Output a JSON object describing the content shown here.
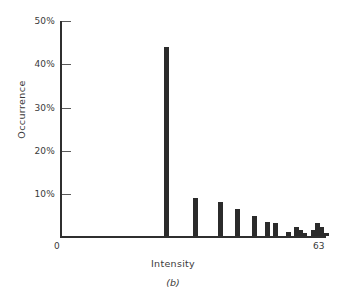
{
  "figure": {
    "caption": "(b)",
    "ylabel": "Occurrence",
    "xlabel": "Intensity",
    "ink_color": "#2b2b2b",
    "background": "#ffffff"
  },
  "chart_data": {
    "type": "bar",
    "title": "",
    "subtitle": "",
    "caption": "(b)",
    "xlabel": "Intensity",
    "ylabel": "Occurrence",
    "xlim": [
      0,
      63
    ],
    "ylim": [
      0,
      50
    ],
    "grid": false,
    "legend": null,
    "ytick_labels": [
      "50%",
      "40%",
      "30%",
      "20%",
      "10%"
    ],
    "ytick_values": [
      50,
      40,
      30,
      20,
      10
    ],
    "xtick_labels": [
      "0",
      "63"
    ],
    "xtick_values": [
      0,
      63
    ],
    "categories": [
      25,
      32,
      38,
      42,
      46,
      49,
      51,
      53,
      56,
      57,
      58,
      60,
      61,
      62,
      63
    ],
    "values": [
      44,
      8.8,
      8.0,
      6.2,
      4.7,
      3.2,
      3.1,
      1.0,
      2.2,
      1.4,
      0.6,
      1.4,
      3.0,
      2.0,
      0.7
    ],
    "bars": [
      {
        "x": 25,
        "value": 44.0
      },
      {
        "x": 32,
        "value": 8.8
      },
      {
        "x": 38,
        "value": 8.0
      },
      {
        "x": 42,
        "value": 6.2
      },
      {
        "x": 46,
        "value": 4.7
      },
      {
        "x": 49,
        "value": 3.2
      },
      {
        "x": 51,
        "value": 3.1
      },
      {
        "x": 54,
        "value": 1.0
      },
      {
        "x": 56,
        "value": 2.2
      },
      {
        "x": 57,
        "value": 1.4
      },
      {
        "x": 58,
        "value": 0.6
      },
      {
        "x": 60,
        "value": 1.4
      },
      {
        "x": 61,
        "value": 3.0
      },
      {
        "x": 62,
        "value": 2.0
      },
      {
        "x": 63,
        "value": 0.7
      }
    ]
  }
}
